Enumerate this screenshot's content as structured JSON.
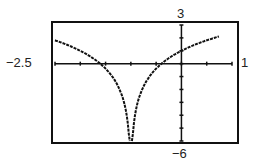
{
  "chart_data": {
    "type": "line",
    "title": "",
    "xlabel": "",
    "ylabel": "",
    "xlim": [
      -2.5,
      1
    ],
    "ylim": [
      -6,
      3
    ],
    "x_tick_step": 0.5,
    "y_tick_step": 1,
    "grid": false,
    "window_labels": {
      "xmin": "-2.5",
      "xmax": "1",
      "ymax": "3",
      "ymin": "-6"
    },
    "series": [
      {
        "name": "f(x)",
        "approx_formula": "2ln|x+1|+1",
        "x": [
          -2.5,
          -2,
          -1.5,
          -1.2,
          -1.05,
          -0.95,
          -0.8,
          -0.5,
          0,
          0.5,
          0.75
        ],
        "values": [
          1.81,
          1.0,
          -0.39,
          -2.22,
          -5.0,
          -5.0,
          -2.22,
          -0.39,
          1.0,
          1.81,
          2.12
        ]
      }
    ]
  },
  "labels": {
    "xmin": "−2.5",
    "xmax": "1",
    "ymax": "3",
    "ymin": "−6"
  }
}
